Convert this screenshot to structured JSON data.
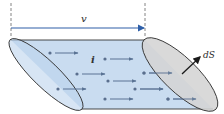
{
  "diagram": {
    "labels": {
      "velocity": "v",
      "current": "i",
      "surface_element": "dS"
    },
    "colors": {
      "tube_fill": "#c9dcf0",
      "left_face_fill": "#bcd3ec",
      "right_face_fill": "#d4d4d4",
      "outline": "#333333",
      "velocity_arrow": "#2e5fa8",
      "flow_arrow": "#5a7394",
      "dot": "#5a6f8e",
      "normal_arrow": "#1a1a1a",
      "dashed_guide": "#666666"
    },
    "flow_particle_count": 9
  }
}
